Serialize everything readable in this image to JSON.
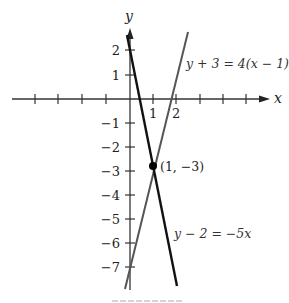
{
  "diagram": {
    "axes": {
      "x_label": "x",
      "y_label": "y",
      "x_tick_labels": [
        {
          "value": 1,
          "text": "1"
        },
        {
          "value": 2,
          "text": "2"
        }
      ],
      "y_tick_labels": [
        {
          "value": 2,
          "text": "2"
        },
        {
          "value": 1,
          "text": "1"
        },
        {
          "value": -1,
          "text": "−1"
        },
        {
          "value": -2,
          "text": "−2"
        },
        {
          "value": -3,
          "text": "−3"
        },
        {
          "value": -4,
          "text": "−4"
        },
        {
          "value": -5,
          "text": "−5"
        },
        {
          "value": -6,
          "text": "−6"
        },
        {
          "value": -7,
          "text": "−7"
        }
      ],
      "x_ticks": [
        -4,
        -3,
        -2,
        -1,
        1,
        2,
        3,
        4,
        5
      ],
      "y_ticks": [
        2,
        1,
        -1,
        -2,
        -3,
        -4,
        -5,
        -6,
        -7
      ]
    },
    "lines": [
      {
        "name": "line-a",
        "equation": "y + 3 = 4(x − 1)",
        "slope": 4,
        "intercept": -7,
        "color": "#555555"
      },
      {
        "name": "line-b",
        "equation": "y − 2 = −5x",
        "slope": -5,
        "intercept": 2,
        "color": "#111111"
      }
    ],
    "intersection": {
      "x": 1,
      "y": -3,
      "label": "(1, −3)"
    },
    "colors": {
      "axis": "#333333",
      "background": "#ffffff"
    }
  }
}
